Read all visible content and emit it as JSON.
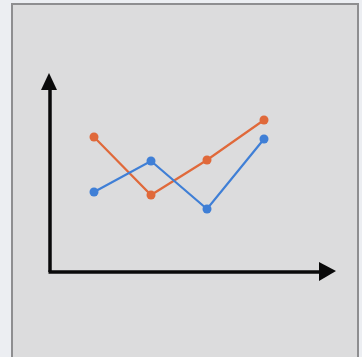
{
  "chart_data": {
    "type": "line",
    "title": "",
    "xlabel": "",
    "ylabel": "",
    "grid": false,
    "legend": null,
    "categories": [
      1,
      2,
      3,
      4
    ],
    "series": [
      {
        "name": "orange",
        "color": "#e0693a",
        "values": [
          137,
          195,
          160,
          120
        ]
      },
      {
        "name": "blue",
        "color": "#3f7fd6",
        "values": [
          192,
          161,
          209,
          139
        ]
      }
    ],
    "pixel_x": [
      94,
      151,
      207,
      264
    ],
    "axis": {
      "origin": [
        50,
        272
      ],
      "y_tip": 74,
      "x_tip": 335,
      "color": "#0a0a0a"
    }
  }
}
